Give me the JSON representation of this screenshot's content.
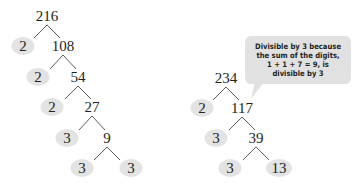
{
  "colors": {
    "prime_fill": "#e3e3e3",
    "callout_fill": "#e1e1e1",
    "text": "#231f20",
    "line": "#4a4a4a"
  },
  "left_tree": {
    "root": "216",
    "levels": [
      {
        "prime": "2",
        "composite": "108"
      },
      {
        "prime": "2",
        "composite": "54"
      },
      {
        "prime": "2",
        "composite": "27"
      },
      {
        "prime": "3",
        "composite": "9"
      },
      {
        "prime": "3",
        "composite": "3",
        "composite_is_prime": true
      }
    ]
  },
  "right_tree": {
    "root": "234",
    "levels": [
      {
        "prime": "2",
        "composite": "117"
      },
      {
        "prime": "3",
        "composite": "39"
      },
      {
        "prime": "3",
        "composite": "13",
        "composite_is_prime": true
      }
    ]
  },
  "callout": {
    "lines": [
      "Divisible by 3 because",
      "the sum of the digits,",
      "1 + 1 + 7 = 9, is",
      "divisible by 3"
    ]
  }
}
